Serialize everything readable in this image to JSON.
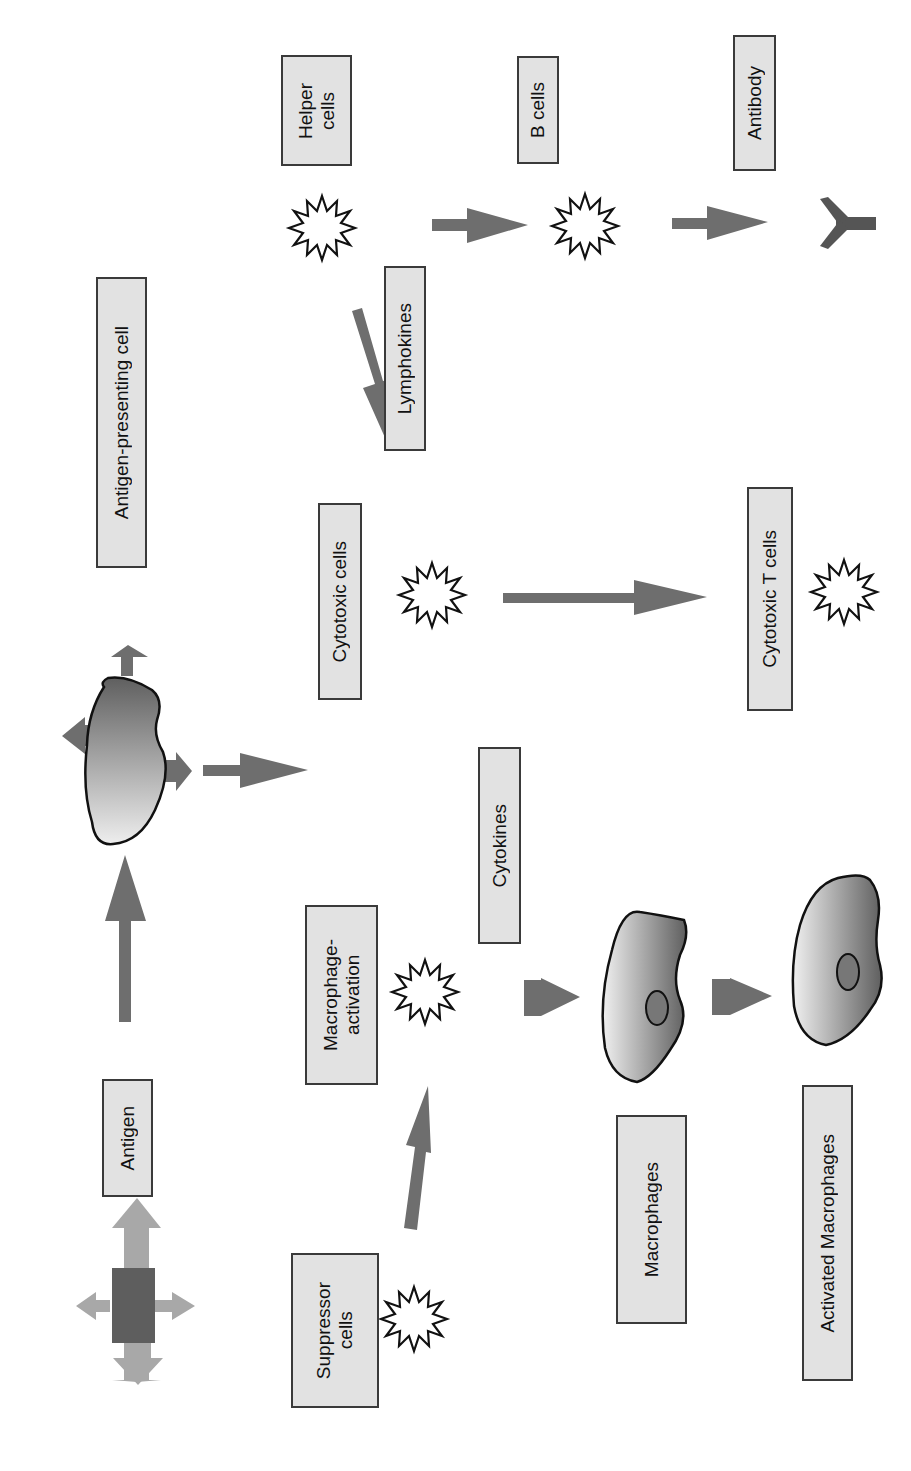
{
  "diagram": {
    "orientation": "rotated 90deg counter-clockwise",
    "colors": {
      "label_fill": "#e2e2e2",
      "label_border": "#3a3a3a",
      "arrow": "#6e6e6e",
      "antigen_arrows": "#a8a8a8",
      "antigen_core": "#5e5e5e",
      "cell_dark": "#6a6a6a",
      "cell_light": "#eeeeee",
      "antibody": "#555555"
    },
    "labels": {
      "antigen": "Antigen",
      "antigen_presenting_cell": "Antigen-presenting cell",
      "helper_cells": "Helper\ncells",
      "b_cells": "B cells",
      "antibody": "Antibody",
      "lymphokines": "Lymphokines",
      "cytotoxic_cells": "Cytotoxic cells",
      "cytotoxic_t_cells": "Cytotoxic T cells",
      "cytokines": "Cytokines",
      "macrophage_activation": "Macrophage-\nactivation",
      "suppressor_cells": "Suppressor\ncells",
      "macrophages": "Macrophages",
      "activated_macrophages": "Activated Macrophages"
    },
    "nodes": [
      {
        "id": "antigen",
        "label": "Antigen",
        "glyph": "cross-arrows"
      },
      {
        "id": "apc",
        "label": "Antigen-presenting cell",
        "glyph": "blob-cell"
      },
      {
        "id": "helper",
        "label": "Helper cells",
        "glyph": "starburst"
      },
      {
        "id": "bcells",
        "label": "B cells",
        "glyph": "starburst"
      },
      {
        "id": "antibody",
        "label": "Antibody",
        "glyph": "y-shape"
      },
      {
        "id": "cytotoxic",
        "label": "Cytotoxic cells",
        "glyph": "starburst"
      },
      {
        "id": "ctl",
        "label": "Cytotoxic T cells",
        "glyph": "starburst"
      },
      {
        "id": "macact",
        "label": "Macrophage-activation",
        "glyph": "starburst"
      },
      {
        "id": "suppressor",
        "label": "Suppressor cells",
        "glyph": "starburst"
      },
      {
        "id": "macrophages",
        "label": "Macrophages",
        "glyph": "nucleated-cell"
      },
      {
        "id": "activated",
        "label": "Activated Macrophages",
        "glyph": "nucleated-cell"
      }
    ],
    "edges": [
      {
        "from": "antigen",
        "to": "apc"
      },
      {
        "from": "apc",
        "to": "cytotoxic"
      },
      {
        "from": "helper",
        "to": "bcells"
      },
      {
        "from": "bcells",
        "to": "antibody"
      },
      {
        "from": "helper",
        "to": "cytotoxic",
        "label": "Lymphokines"
      },
      {
        "from": "cytotoxic",
        "to": "ctl"
      },
      {
        "from": "suppressor",
        "to": "macact"
      },
      {
        "from": "macact",
        "to": "macrophages",
        "label": "Cytokines"
      },
      {
        "from": "macrophages",
        "to": "activated"
      }
    ]
  }
}
